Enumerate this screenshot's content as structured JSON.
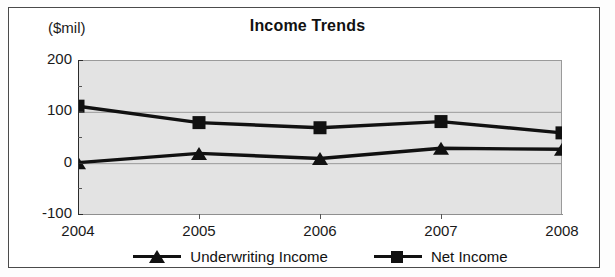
{
  "chart_data": {
    "type": "line",
    "title": "Income Trends",
    "unit_label": "($mil)",
    "xlabel": "",
    "ylabel": "",
    "categories": [
      "2004",
      "2005",
      "2006",
      "2007",
      "2008"
    ],
    "ylim": [
      -100,
      200
    ],
    "yticks": [
      "-100",
      "0",
      "100",
      "200"
    ],
    "ytick_values": [
      -100,
      0,
      100,
      200
    ],
    "minor_ytick_values": [
      -50,
      50,
      150
    ],
    "grid": true,
    "grid_axis": "y",
    "legend_position": "bottom",
    "series": [
      {
        "name": "Underwriting Income",
        "marker": "triangle",
        "color": "#111111",
        "values": [
          2,
          20,
          10,
          30,
          28
        ]
      },
      {
        "name": "Net Income",
        "marker": "square",
        "color": "#111111",
        "values": [
          112,
          80,
          70,
          82,
          60
        ]
      }
    ]
  },
  "figure": {
    "plot_background": "#e3e3e3",
    "page_background": "#ffffff",
    "border_color": "#4a4a4a",
    "line_color": "#111111"
  }
}
